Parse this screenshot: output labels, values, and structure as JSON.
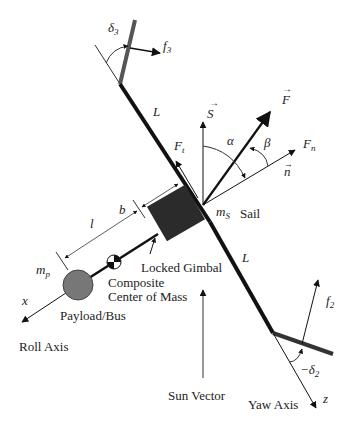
{
  "diagram": {
    "labels": {
      "delta3": "δ",
      "delta3_sub": "3",
      "f3": "f",
      "f3_sub": "3",
      "L_upper": "L",
      "L_lower": "L",
      "S": "S",
      "F": "F",
      "Ft": "F",
      "Ft_sub": "t",
      "Fn": "F",
      "Fn_sub": "n",
      "n": "n",
      "alpha": "α",
      "beta": "β",
      "b": "b",
      "l": "l",
      "ms": "m",
      "ms_sub": "S",
      "sail": "Sail",
      "mp": "m",
      "mp_sub": "p",
      "locked_gimbal": "Locked Gimbal",
      "composite_line1": "Composite",
      "composite_line2": "Center of Mass",
      "x": "x",
      "payload": "Payload/Bus",
      "roll_axis": "Roll Axis",
      "sun_vector": "Sun Vector",
      "yaw_axis": "Yaw Axis",
      "z": "z",
      "f2": "f",
      "f2_sub": "2",
      "neg_delta2": "−δ",
      "neg_delta2_sub": "2"
    },
    "colors": {
      "boom": "#111111",
      "vane": "#444444",
      "gimbal": "#2b2b2b",
      "payload": "#777777",
      "thin": "#333333"
    }
  }
}
